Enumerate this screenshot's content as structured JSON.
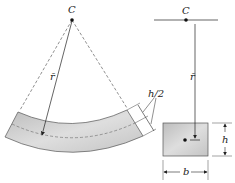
{
  "left_figure": {
    "center_label": "C",
    "radius_label": "r̄",
    "half_thickness_label": "h/2"
  },
  "right_figure": {
    "center_label": "C",
    "radius_label": "r̄",
    "height_label": "h",
    "width_label": "b"
  },
  "colors": {
    "band_fill": "#c8c8c8",
    "line": "#333333"
  }
}
